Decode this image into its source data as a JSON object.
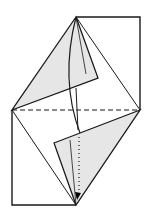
{
  "diagram": {
    "type": "origami-fold-step",
    "colors": {
      "background": "#ffffff",
      "line": "#1a1a1a",
      "flap_fill": "#e6e6e6",
      "arrow": "#000000"
    },
    "points": {
      "top_apex": [
        76,
        17
      ],
      "top_right": [
        140,
        17
      ],
      "left": [
        12,
        110
      ],
      "right": [
        140,
        110
      ],
      "bottom_apex": [
        76,
        205
      ],
      "bottom_left": [
        12,
        205
      ],
      "upper_flap_tip": [
        98,
        78
      ],
      "lower_flap_tip": [
        54,
        143
      ]
    },
    "lines": {
      "horizontal_dashed_fold": "valley-fold",
      "vertical_dotted": "mountain-fold"
    }
  }
}
